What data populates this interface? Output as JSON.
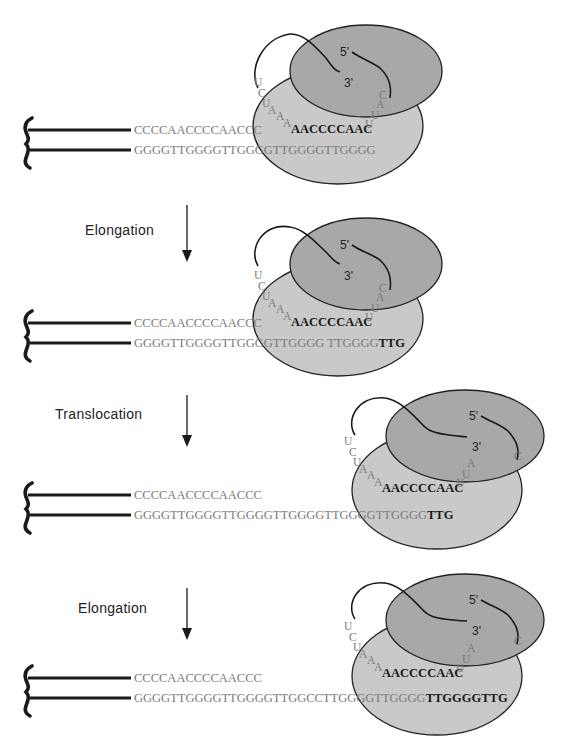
{
  "figure": {
    "colors": {
      "dna_line": "#1a1a1a",
      "sequence_text": "#7a7a7a",
      "new_nucleotides": "#1a1a1a",
      "large_subunit": "#c9c9c9",
      "small_subunit": "#a8a8a8"
    },
    "panels": [
      {
        "id": 1,
        "top_strand": "CCCCAACCCCAACCC",
        "bottom_strand": "GGGGTTGGGGTTGGGGTTGGGGTTGGGG",
        "bottom_strand_new": "",
        "rna_template_left": [
          "U",
          "C",
          "U",
          "A",
          "A",
          "A"
        ],
        "rna_template_core": "AACCCCAAC",
        "rna_template_right": [
          "U",
          "U",
          "A",
          "C"
        ],
        "rna_5prime": "5'",
        "rna_3prime": "3'"
      },
      {
        "id": 2,
        "step_label": "Elongation",
        "top_strand": "CCCCAACCCCAACCC",
        "bottom_strand": "GGGGTTGGGGTTGGGGTTGGGG TTGGGG",
        "bottom_strand_new": "TTG",
        "rna_template_left": [
          "U",
          "C",
          "U",
          "A",
          "A",
          "A"
        ],
        "rna_template_core": "AACCCCAAC",
        "rna_template_right": [
          "U",
          "U",
          "A",
          "C"
        ],
        "rna_5prime": "5'",
        "rna_3prime": "3'"
      },
      {
        "id": 3,
        "step_label": "Translocation",
        "top_strand": "CCCCAACCCCAACCC",
        "bottom_strand": "GGGGTTGGGGTTGGGGTTGGGGTTGGGGTTGGGG",
        "bottom_strand_new": "TTG",
        "rna_template_left": [
          "U",
          "C",
          "U",
          "A",
          "A",
          "A"
        ],
        "rna_template_core": "AACCCCAAC",
        "rna_template_right": [
          "U",
          "U",
          "A",
          "C"
        ],
        "rna_5prime": "5'",
        "rna_3prime": "3'"
      },
      {
        "id": 4,
        "step_label": "Elongation",
        "top_strand": "CCCCAACCCCAACCC",
        "bottom_strand": "GGGGTTGGGGTTGGGGTTGGCCTTGGGGTTGGGG",
        "bottom_strand_new": "TTGGGGTTG",
        "rna_template_left": [
          "U",
          "C",
          "U",
          "A",
          "A",
          "A"
        ],
        "rna_template_core": "AACCCCAAC",
        "rna_template_right": [
          "U",
          "U",
          "A",
          "C"
        ],
        "rna_5prime": "5'",
        "rna_3prime": "3'"
      }
    ]
  }
}
